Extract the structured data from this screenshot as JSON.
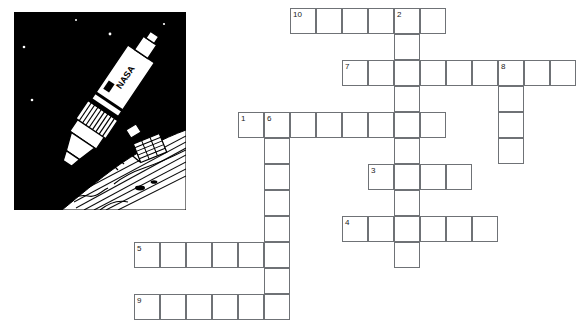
{
  "page": {
    "type": "crossword-puzzle-worksheet",
    "background_color": "#ffffff",
    "grid_line_color": "#6f7276",
    "number_color": "#1a1a1a"
  },
  "illustration": {
    "name": "rocket-in-space-illustration",
    "subject": "NASA rocket / launch vehicle in orbit above Earth",
    "label_on_rocket": "NASA",
    "sky_color": "#000000",
    "rocket_color": "#ffffff",
    "earth_color": "#ffffff",
    "stars_color": "#ffffff",
    "star_count": 6
  },
  "crossword": {
    "cell_size": 26,
    "origin_x": 134,
    "origin_y": 8,
    "entries": [
      {
        "number": "10",
        "direction": "across",
        "row": 0,
        "col": 6,
        "length": 6
      },
      {
        "number": "2",
        "direction": "down",
        "row": 0,
        "col": 10,
        "length": 10
      },
      {
        "number": "7",
        "direction": "across",
        "row": 2,
        "col": 8,
        "length": 9
      },
      {
        "number": "8",
        "direction": "down",
        "row": 2,
        "col": 14,
        "length": 4
      },
      {
        "number": "1",
        "direction": "across",
        "row": 4,
        "col": 4,
        "length": 8
      },
      {
        "number": "6",
        "direction": "down",
        "row": 4,
        "col": 5,
        "length": 8
      },
      {
        "number": "3",
        "direction": "across",
        "row": 6,
        "col": 9,
        "length": 4
      },
      {
        "number": "4",
        "direction": "across",
        "row": 8,
        "col": 8,
        "length": 6
      },
      {
        "number": "5",
        "direction": "across",
        "row": 9,
        "col": 0,
        "length": 6
      },
      {
        "number": "9",
        "direction": "across",
        "row": 11,
        "col": 0,
        "length": 6
      }
    ],
    "numbered_cells": [
      {
        "label": "10",
        "row": 0,
        "col": 6
      },
      {
        "label": "2",
        "row": 0,
        "col": 10
      },
      {
        "label": "7",
        "row": 2,
        "col": 8
      },
      {
        "label": "8",
        "row": 2,
        "col": 14
      },
      {
        "label": "1",
        "row": 4,
        "col": 4
      },
      {
        "label": "6",
        "row": 4,
        "col": 5
      },
      {
        "label": "3",
        "row": 6,
        "col": 9
      },
      {
        "label": "4",
        "row": 8,
        "col": 8
      },
      {
        "label": "5",
        "row": 9,
        "col": 0
      },
      {
        "label": "9",
        "row": 11,
        "col": 0
      }
    ]
  }
}
